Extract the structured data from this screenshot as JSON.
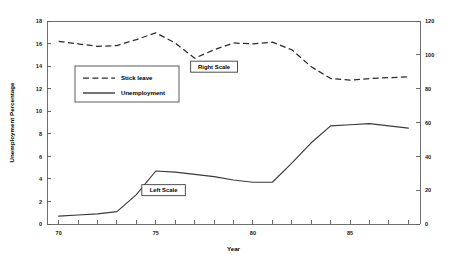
{
  "chart_data": {
    "type": "line",
    "title": "",
    "xlabel": "Year",
    "ylabel": "Unemployment Percentage",
    "ylabel_right": "",
    "xlim": [
      69.4,
      88.6
    ],
    "ylim": [
      0,
      18
    ],
    "ylim_right": [
      0,
      120
    ],
    "grid": false,
    "legend_position": "upper-left-inside",
    "x_ticks": [
      70,
      71,
      72,
      73,
      74,
      75,
      76,
      77,
      78,
      79,
      80,
      81,
      82,
      83,
      84,
      85,
      86,
      87,
      88
    ],
    "x_tick_labels": [
      "70",
      "",
      "",
      "",
      "",
      "75",
      "",
      "",
      "",
      "",
      "80",
      "",
      "",
      "",
      "",
      "85",
      "",
      "",
      ""
    ],
    "y_ticks_left": [
      0,
      2,
      4,
      6,
      8,
      10,
      12,
      14,
      16,
      18
    ],
    "y_tick_labels_left": [
      "0",
      "2",
      "4",
      "6",
      "8",
      "10",
      "12",
      "14",
      "16",
      "18"
    ],
    "y_ticks_right": [
      0,
      20,
      40,
      60,
      80,
      100,
      120
    ],
    "y_tick_labels_right": [
      "0",
      "20",
      "40",
      "60",
      "80",
      "100",
      "120"
    ],
    "x": [
      70,
      71,
      72,
      73,
      74,
      75,
      76,
      77,
      78,
      79,
      80,
      81,
      82,
      83,
      84,
      85,
      86,
      87,
      88
    ],
    "series": [
      {
        "name": "Stick leave",
        "axis": "right",
        "style": "dashed",
        "values": [
          108,
          106.5,
          105,
          105.5,
          109,
          113,
          107,
          98,
          103,
          107,
          106.5,
          107.5,
          103,
          93,
          86,
          85,
          86,
          86.5,
          87
        ]
      },
      {
        "name": "Unemployment",
        "axis": "left",
        "style": "solid",
        "values": [
          0.7,
          0.8,
          0.9,
          1.1,
          2.6,
          4.7,
          4.6,
          4.4,
          4.2,
          3.9,
          3.7,
          3.7,
          5.4,
          7.2,
          8.7,
          8.8,
          8.9,
          8.7,
          8.5
        ]
      }
    ],
    "annotations": [
      {
        "text": "Right Scale",
        "x": 78.0,
        "y_right": 93
      },
      {
        "text": "Left Scale",
        "x": 75.4,
        "y_left": 3.0
      }
    ],
    "legend": [
      {
        "label": "Stick leave",
        "style": "dashed"
      },
      {
        "label": "Unemployment",
        "style": "solid"
      }
    ]
  }
}
